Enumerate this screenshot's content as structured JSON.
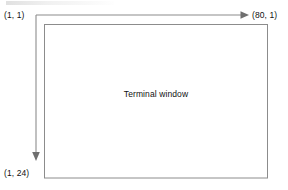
{
  "diagram": {
    "type": "annotated-rectangle",
    "background_color": "#ffffff",
    "line_color": "#8c8c8c",
    "text_color": "#111111",
    "terminal": {
      "label": "Terminal window",
      "columns": 80,
      "rows": 24
    },
    "labels": {
      "origin": "(1, 1)",
      "top_right": "(80, 1)",
      "bottom_left": "(1, 24)"
    },
    "arrows": {
      "horizontal": {
        "name": "columns-axis-arrow",
        "from": "(1, 1)",
        "to": "(80, 1)",
        "direction": "right"
      },
      "vertical": {
        "name": "rows-axis-arrow",
        "from": "(1, 1)",
        "to": "(1, 24)",
        "direction": "down"
      }
    }
  }
}
